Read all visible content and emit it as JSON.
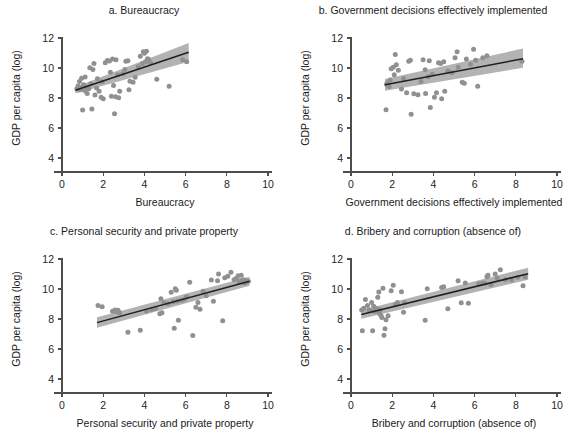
{
  "figure": {
    "background": "#ffffff",
    "point_color": "#909090",
    "band_color": "#b3b3b3",
    "line_color": "#1f1f1f",
    "axis_color": "#4d4d4d"
  },
  "axes_common": {
    "ylabel": "GDP per capita (log)",
    "yticks": [
      4,
      6,
      8,
      10,
      12
    ],
    "xticks": [
      0,
      2,
      4,
      6,
      8,
      10
    ],
    "xlim": [
      0,
      10
    ],
    "ylim": [
      3.4,
      12.6
    ],
    "grid": false,
    "legend": "none"
  },
  "chart_data": [
    {
      "id": "a",
      "type": "scatter",
      "title": "a. Bureaucracy",
      "xlabel": "Bureaucracy",
      "ylabel": "GDP per capita (log)",
      "xlim": [
        0,
        10
      ],
      "ylim": [
        3.4,
        12.6
      ],
      "xticks": [
        0,
        2,
        4,
        6,
        8,
        10
      ],
      "yticks": [
        4,
        6,
        8,
        10,
        12
      ],
      "grid": false,
      "fit": {
        "x0": 0.65,
        "y0": 8.52,
        "x1": 6.15,
        "y1": 11.05
      },
      "band": {
        "x0": 0.65,
        "lo0": 8.3,
        "hi0": 8.74,
        "x1": 6.15,
        "lo1": 10.42,
        "hi1": 11.66
      },
      "points": [
        [
          0.72,
          8.62
        ],
        [
          0.78,
          8.8
        ],
        [
          0.85,
          9.1
        ],
        [
          0.88,
          8.55
        ],
        [
          0.92,
          8.7
        ],
        [
          0.95,
          9.32
        ],
        [
          1.0,
          7.2
        ],
        [
          1.05,
          8.88
        ],
        [
          1.1,
          8.5
        ],
        [
          1.12,
          9.4
        ],
        [
          1.18,
          8.74
        ],
        [
          1.22,
          8.3
        ],
        [
          1.3,
          8.62
        ],
        [
          1.35,
          10.02
        ],
        [
          1.4,
          8.95
        ],
        [
          1.45,
          7.26
        ],
        [
          1.5,
          9.9
        ],
        [
          1.55,
          10.3
        ],
        [
          1.6,
          8.2
        ],
        [
          1.68,
          8.66
        ],
        [
          1.72,
          9.28
        ],
        [
          1.8,
          8.45
        ],
        [
          1.9,
          8.05
        ],
        [
          1.95,
          9.08
        ],
        [
          2.0,
          7.95
        ],
        [
          2.1,
          10.35
        ],
        [
          2.2,
          10.5
        ],
        [
          2.3,
          10.46
        ],
        [
          2.35,
          9.72
        ],
        [
          2.4,
          8.12
        ],
        [
          2.45,
          10.6
        ],
        [
          2.5,
          8.84
        ],
        [
          2.55,
          6.95
        ],
        [
          2.6,
          8.08
        ],
        [
          2.62,
          10.55
        ],
        [
          2.7,
          9.55
        ],
        [
          2.75,
          8.02
        ],
        [
          2.8,
          8.45
        ],
        [
          2.95,
          9.62
        ],
        [
          3.05,
          9.9
        ],
        [
          3.1,
          10.45
        ],
        [
          3.2,
          10.48
        ],
        [
          3.25,
          8.55
        ],
        [
          3.3,
          9.12
        ],
        [
          3.45,
          9.05
        ],
        [
          3.55,
          9.38
        ],
        [
          3.7,
          10.08
        ],
        [
          3.8,
          10.78
        ],
        [
          3.9,
          10.3
        ],
        [
          3.95,
          11.08
        ],
        [
          4.0,
          10.98
        ],
        [
          4.05,
          10.42
        ],
        [
          4.1,
          11.12
        ],
        [
          4.15,
          10.62
        ],
        [
          4.2,
          10.58
        ],
        [
          4.3,
          10.35
        ],
        [
          4.6,
          9.25
        ],
        [
          5.2,
          8.78
        ],
        [
          5.85,
          10.55
        ],
        [
          6.05,
          10.42
        ]
      ]
    },
    {
      "id": "b",
      "type": "scatter",
      "title": "b. Government decisions effectively implemented",
      "xlabel": "Government decisions effectively implemented",
      "ylabel": "GDP per capita (log)",
      "xlim": [
        0,
        10
      ],
      "ylim": [
        3.4,
        12.6
      ],
      "xticks": [
        0,
        2,
        4,
        6,
        8,
        10
      ],
      "yticks": [
        4,
        6,
        8,
        10,
        12
      ],
      "grid": false,
      "fit": {
        "x0": 1.65,
        "y0": 8.88,
        "x1": 8.35,
        "y1": 10.62
      },
      "band": {
        "x0": 1.65,
        "lo0": 8.48,
        "hi0": 9.26,
        "x1": 8.35,
        "lo1": 10.02,
        "hi1": 11.3
      },
      "points": [
        [
          1.7,
          7.22
        ],
        [
          1.72,
          8.92
        ],
        [
          1.78,
          9.0
        ],
        [
          1.85,
          8.76
        ],
        [
          1.9,
          9.2
        ],
        [
          1.95,
          9.95
        ],
        [
          2.05,
          10.05
        ],
        [
          2.1,
          9.55
        ],
        [
          2.15,
          10.9
        ],
        [
          2.2,
          10.22
        ],
        [
          2.3,
          9.85
        ],
        [
          2.45,
          8.6
        ],
        [
          2.55,
          9.3
        ],
        [
          2.7,
          8.35
        ],
        [
          2.8,
          10.45
        ],
        [
          2.88,
          10.52
        ],
        [
          2.92,
          6.92
        ],
        [
          3.05,
          8.28
        ],
        [
          3.25,
          8.22
        ],
        [
          3.4,
          9.1
        ],
        [
          3.5,
          10.55
        ],
        [
          3.6,
          9.88
        ],
        [
          3.62,
          8.3
        ],
        [
          3.75,
          9.42
        ],
        [
          3.8,
          10.48
        ],
        [
          3.85,
          7.36
        ],
        [
          3.95,
          9.58
        ],
        [
          4.05,
          8.05
        ],
        [
          4.15,
          8.35
        ],
        [
          4.25,
          10.35
        ],
        [
          4.35,
          10.3
        ],
        [
          4.4,
          7.95
        ],
        [
          4.5,
          10.42
        ],
        [
          4.55,
          8.45
        ],
        [
          4.7,
          9.8
        ],
        [
          4.9,
          9.68
        ],
        [
          5.05,
          10.68
        ],
        [
          5.15,
          11.08
        ],
        [
          5.2,
          10.05
        ],
        [
          5.4,
          9.05
        ],
        [
          5.5,
          8.98
        ],
        [
          5.6,
          10.6
        ],
        [
          5.8,
          10.25
        ],
        [
          5.95,
          11.25
        ],
        [
          6.05,
          10.52
        ],
        [
          6.15,
          8.78
        ],
        [
          6.4,
          10.68
        ],
        [
          6.6,
          10.82
        ],
        [
          8.3,
          10.45
        ]
      ]
    },
    {
      "id": "c",
      "type": "scatter",
      "title": "c. Personal security and private property",
      "xlabel": "Personal security and private property",
      "ylabel": "GDP per capita (log)",
      "xlim": [
        0,
        10
      ],
      "ylim": [
        3.4,
        12.6
      ],
      "xticks": [
        0,
        2,
        4,
        6,
        8,
        10
      ],
      "yticks": [
        4,
        6,
        8,
        10,
        12
      ],
      "grid": false,
      "fit": {
        "x0": 1.7,
        "y0": 7.76,
        "x1": 9.1,
        "y1": 10.52
      },
      "band": {
        "x0": 1.7,
        "lo0": 7.42,
        "hi0": 8.12,
        "x1": 9.1,
        "lo1": 10.22,
        "hi1": 10.82
      },
      "points": [
        [
          1.75,
          8.9
        ],
        [
          1.95,
          8.82
        ],
        [
          2.45,
          8.52
        ],
        [
          2.55,
          8.55
        ],
        [
          2.58,
          8.6
        ],
        [
          2.65,
          8.48
        ],
        [
          2.72,
          8.58
        ],
        [
          2.8,
          8.42
        ],
        [
          3.2,
          7.12
        ],
        [
          3.8,
          7.25
        ],
        [
          4.1,
          8.52
        ],
        [
          4.35,
          8.62
        ],
        [
          4.55,
          8.7
        ],
        [
          4.75,
          8.35
        ],
        [
          4.8,
          9.35
        ],
        [
          4.85,
          8.42
        ],
        [
          4.95,
          9.08
        ],
        [
          5.15,
          9.02
        ],
        [
          5.3,
          9.78
        ],
        [
          5.4,
          9.15
        ],
        [
          5.45,
          7.38
        ],
        [
          5.5,
          10.02
        ],
        [
          5.55,
          9.92
        ],
        [
          5.6,
          9.2
        ],
        [
          5.65,
          7.92
        ],
        [
          5.8,
          9.25
        ],
        [
          5.95,
          9.32
        ],
        [
          6.05,
          9.48
        ],
        [
          6.2,
          10.45
        ],
        [
          6.35,
          6.9
        ],
        [
          6.5,
          8.78
        ],
        [
          6.6,
          9.1
        ],
        [
          6.7,
          8.65
        ],
        [
          6.85,
          9.85
        ],
        [
          7.0,
          9.55
        ],
        [
          7.25,
          10.6
        ],
        [
          7.35,
          9.18
        ],
        [
          7.55,
          10.55
        ],
        [
          7.6,
          11.0
        ],
        [
          7.8,
          7.88
        ],
        [
          7.9,
          10.75
        ],
        [
          8.05,
          10.85
        ],
        [
          8.2,
          11.12
        ],
        [
          8.35,
          10.62
        ],
        [
          8.45,
          10.7
        ],
        [
          8.55,
          10.88
        ],
        [
          8.6,
          10.45
        ],
        [
          8.65,
          10.55
        ],
        [
          8.7,
          10.92
        ],
        [
          8.75,
          10.48
        ],
        [
          8.8,
          10.62
        ],
        [
          8.85,
          10.4
        ],
        [
          8.9,
          10.58
        ],
        [
          8.95,
          10.45
        ],
        [
          9.0,
          10.5
        ],
        [
          9.05,
          10.52
        ]
      ]
    },
    {
      "id": "d",
      "type": "scatter",
      "title": "d. Bribery and corruption (absence of)",
      "xlabel": "Bribery and corruption (absence of)",
      "ylabel": "GDP per capita (log)",
      "xlim": [
        0,
        10
      ],
      "ylim": [
        3.4,
        12.6
      ],
      "xticks": [
        0,
        2,
        4,
        6,
        8,
        10
      ],
      "yticks": [
        4,
        6,
        8,
        10,
        12
      ],
      "grid": false,
      "fit": {
        "x0": 0.5,
        "y0": 8.3,
        "x1": 8.6,
        "y1": 11.02
      },
      "band": {
        "x0": 0.5,
        "lo0": 8.02,
        "hi0": 8.58,
        "x1": 8.6,
        "lo1": 10.62,
        "hi1": 11.42
      },
      "points": [
        [
          0.52,
          8.6
        ],
        [
          0.55,
          7.22
        ],
        [
          0.62,
          8.72
        ],
        [
          0.7,
          9.3
        ],
        [
          0.8,
          8.9
        ],
        [
          0.88,
          8.62
        ],
        [
          0.95,
          8.55
        ],
        [
          1.0,
          9.1
        ],
        [
          1.05,
          7.22
        ],
        [
          1.1,
          8.85
        ],
        [
          1.15,
          8.5
        ],
        [
          1.2,
          8.72
        ],
        [
          1.25,
          8.68
        ],
        [
          1.28,
          8.6
        ],
        [
          1.3,
          9.45
        ],
        [
          1.32,
          8.55
        ],
        [
          1.35,
          9.8
        ],
        [
          1.38,
          8.38
        ],
        [
          1.42,
          8.62
        ],
        [
          1.45,
          8.25
        ],
        [
          1.5,
          8.1
        ],
        [
          1.55,
          10.05
        ],
        [
          1.6,
          6.92
        ],
        [
          1.65,
          7.35
        ],
        [
          1.7,
          7.95
        ],
        [
          1.8,
          8.22
        ],
        [
          1.95,
          9.88
        ],
        [
          2.05,
          10.25
        ],
        [
          2.15,
          8.95
        ],
        [
          2.25,
          9.1
        ],
        [
          2.45,
          9.82
        ],
        [
          2.55,
          8.45
        ],
        [
          2.6,
          9.08
        ],
        [
          3.6,
          7.92
        ],
        [
          3.7,
          10.02
        ],
        [
          4.4,
          10.1
        ],
        [
          4.5,
          10.15
        ],
        [
          4.7,
          8.68
        ],
        [
          5.2,
          10.55
        ],
        [
          5.35,
          9.08
        ],
        [
          5.55,
          10.4
        ],
        [
          5.7,
          9.05
        ],
        [
          6.2,
          10.35
        ],
        [
          6.4,
          10.4
        ],
        [
          6.5,
          10.38
        ],
        [
          6.6,
          10.82
        ],
        [
          6.65,
          10.92
        ],
        [
          6.8,
          10.28
        ],
        [
          7.0,
          11.0
        ],
        [
          7.1,
          10.72
        ],
        [
          7.25,
          11.28
        ],
        [
          7.5,
          10.62
        ],
        [
          7.8,
          10.6
        ],
        [
          8.1,
          10.78
        ],
        [
          8.35,
          10.22
        ],
        [
          8.45,
          10.8
        ]
      ]
    }
  ]
}
